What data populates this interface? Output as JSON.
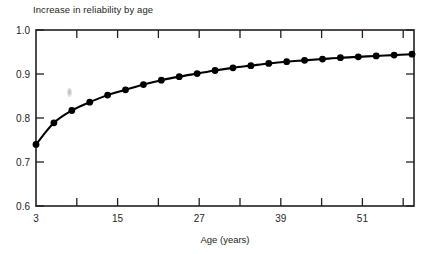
{
  "chart_data": {
    "type": "line",
    "title": "Increase in reliability by age",
    "xlabel": "Age (years)",
    "ylabel": "",
    "xlim": [
      3,
      60
    ],
    "ylim": [
      0.6,
      1.0
    ],
    "grid": false,
    "legend": null,
    "marker": "filled-circle",
    "line_color": "#000000",
    "marker_color": "#000000",
    "xticks": [
      3,
      9,
      15,
      21,
      27,
      33,
      39,
      45,
      51,
      57
    ],
    "xtick_labels": [
      "3",
      "",
      "15",
      "",
      "27",
      "",
      "39",
      "",
      "51",
      ""
    ],
    "xtick_labels_visible": [
      "3",
      "15",
      "27",
      "39",
      "51"
    ],
    "yticks": [
      0.6,
      0.7,
      0.8,
      0.9,
      1.0
    ],
    "ytick_labels": [
      "0.6",
      "0.7",
      "0.8",
      "0.9",
      "1.0"
    ],
    "series": [
      {
        "name": "reliability",
        "x": [
          3,
          5.7,
          8.4,
          11.1,
          13.8,
          16.5,
          19.2,
          21.9,
          24.6,
          27.3,
          30,
          32.7,
          35.4,
          38.1,
          40.8,
          43.5,
          46.2,
          48.9,
          51.6,
          54.3,
          57,
          59.7
        ],
        "values": [
          0.74,
          0.789,
          0.817,
          0.836,
          0.852,
          0.864,
          0.876,
          0.886,
          0.894,
          0.901,
          0.908,
          0.914,
          0.919,
          0.924,
          0.928,
          0.931,
          0.934,
          0.937,
          0.939,
          0.941,
          0.943,
          0.945
        ]
      }
    ],
    "annotations": [
      {
        "name": "gray-smudge-artifact",
        "x": 11.0,
        "y": 0.845
      }
    ]
  }
}
